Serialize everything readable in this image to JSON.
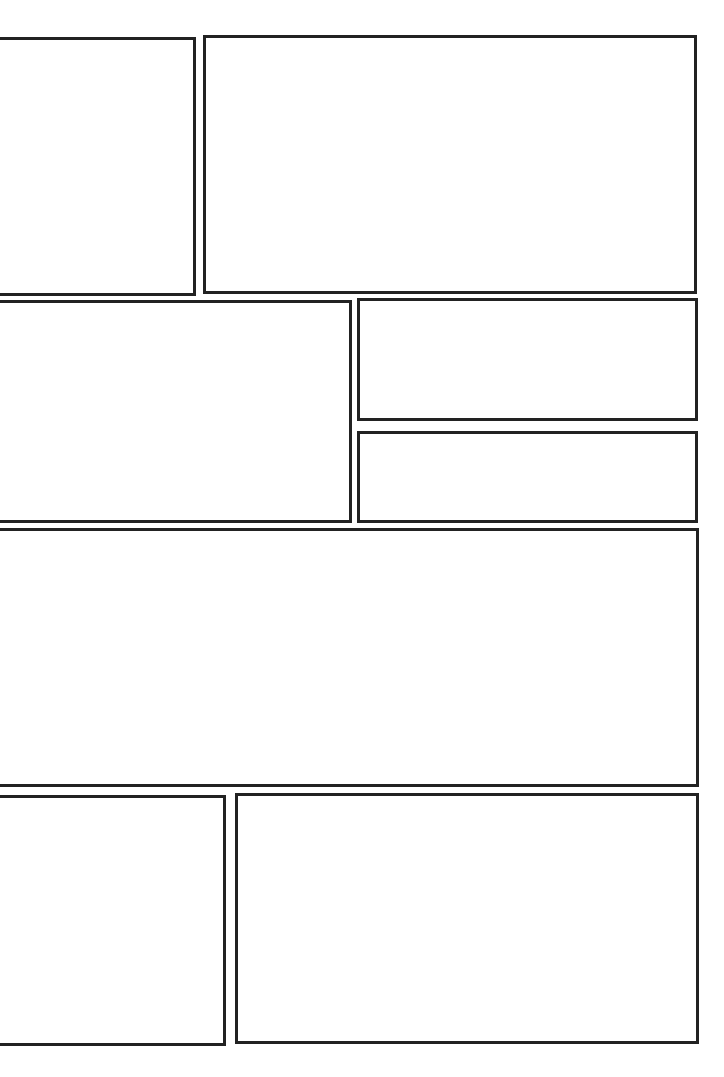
{
  "page": {
    "type": "blank comic page layout",
    "background_color": "#ffffff",
    "border_color": "#222222",
    "border_width_px": 3,
    "panel_count": 8
  },
  "panels": [
    {
      "id": 1,
      "row": 1,
      "left": -3,
      "top": 37,
      "width": 199,
      "height": 259
    },
    {
      "id": 2,
      "row": 1,
      "left": 203,
      "top": 35,
      "width": 494,
      "height": 259
    },
    {
      "id": 3,
      "row": 2,
      "left": -3,
      "top": 300,
      "width": 355,
      "height": 223
    },
    {
      "id": 4,
      "row": 2,
      "left": 357,
      "top": 298,
      "width": 341,
      "height": 123
    },
    {
      "id": 5,
      "row": 2,
      "left": 357,
      "top": 431,
      "width": 341,
      "height": 92
    },
    {
      "id": 6,
      "row": 3,
      "left": -3,
      "top": 528,
      "width": 702,
      "height": 259
    },
    {
      "id": 7,
      "row": 4,
      "left": -3,
      "top": 795,
      "width": 229,
      "height": 251
    },
    {
      "id": 8,
      "row": 4,
      "left": 235,
      "top": 793,
      "width": 464,
      "height": 251
    }
  ]
}
